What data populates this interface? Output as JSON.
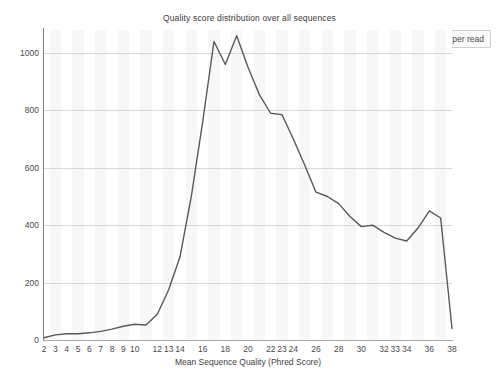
{
  "chart_data": {
    "type": "line",
    "title": "Quality score distribution over all sequences",
    "xlabel": "Mean Sequence Quality (Phred Score)",
    "ylabel": "",
    "legend": [
      "Average Quality per read"
    ],
    "legend_position": "top-right",
    "grid": true,
    "xlim": [
      2,
      38
    ],
    "ylim": [
      0,
      1080
    ],
    "yticks": [
      0,
      200,
      400,
      600,
      800,
      1000
    ],
    "xticks": [
      2,
      3,
      4,
      5,
      6,
      7,
      8,
      9,
      10,
      12,
      13,
      14,
      16,
      18,
      20,
      22,
      23,
      24,
      26,
      28,
      30,
      32,
      33,
      34,
      36,
      38
    ],
    "series": [
      {
        "name": "Average Quality per read",
        "color": "#595959",
        "x": [
          2,
          3,
          4,
          5,
          6,
          7,
          8,
          9,
          10,
          11,
          12,
          13,
          14,
          15,
          16,
          17,
          18,
          19,
          20,
          21,
          22,
          23,
          24,
          25,
          26,
          27,
          28,
          29,
          30,
          31,
          32,
          33,
          34,
          35,
          36,
          37,
          38
        ],
        "values": [
          8,
          18,
          22,
          22,
          25,
          30,
          38,
          48,
          55,
          52,
          90,
          175,
          290,
          500,
          760,
          1040,
          960,
          1060,
          950,
          855,
          790,
          785,
          700,
          610,
          515,
          500,
          475,
          430,
          395,
          400,
          375,
          355,
          345,
          390,
          450,
          425,
          40
        ]
      }
    ]
  },
  "chart": {
    "title": "Quality score distribution over all sequences",
    "legend_label": "Average Quality per read",
    "xlabel": "Mean Sequence Quality (Phred Score)"
  }
}
